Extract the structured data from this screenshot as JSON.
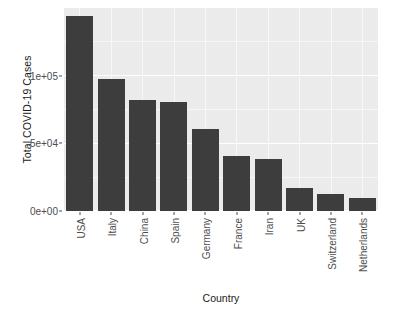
{
  "chart_data": {
    "type": "bar",
    "title": "",
    "subtitle": "",
    "xlabel": "Country",
    "ylabel": "Total COVID-19 Cases",
    "categories": [
      "USA",
      "Italy",
      "China",
      "Spain",
      "Germany",
      "France",
      "Iran",
      "UK",
      "Switzerland",
      "Netherlands"
    ],
    "values": [
      143900,
      97700,
      81800,
      80300,
      60800,
      40700,
      38300,
      17100,
      12900,
      9800
    ],
    "ylim": [
      0,
      150000
    ],
    "xlim_categorical": true,
    "y_tick_values": [
      0,
      50000,
      100000
    ],
    "y_tick_labels": [
      "0e+00",
      "5e+04",
      "1e+05"
    ],
    "grid": "horizontal-and-vertical-white-on-gray",
    "legend": "none",
    "bar_color": "#3d3d3d",
    "panel_background": "#ebebeb",
    "gridline_color": "#ffffff",
    "axis_text_color": "#4d4d4d",
    "axis_title_color": "#1a1a1a"
  },
  "axes": {
    "y_title": "Total COVID-19 Cases",
    "x_title": "Country"
  }
}
